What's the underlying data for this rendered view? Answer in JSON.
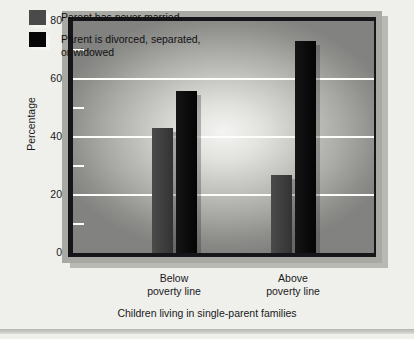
{
  "chart_data": {
    "type": "bar",
    "title": "",
    "xlabel": "Children living in single-parent families",
    "ylabel": "Percentage",
    "categories": [
      "Below\npoverty line",
      "Above\npoverty line"
    ],
    "series": [
      {
        "name": "Parent has never married",
        "values": [
          43,
          27
        ],
        "color": "#3d3d3d"
      },
      {
        "name": "Parent is divorced, separated,\nor widowed",
        "values": [
          56,
          73
        ],
        "color": "#070707"
      }
    ],
    "ylim": [
      0,
      80
    ],
    "yticks": [
      0,
      20,
      40,
      60,
      80
    ],
    "ytick_labels": [
      "0",
      "20",
      "40",
      "60",
      "80"
    ],
    "minor_tick_step": 10,
    "gridlines": [
      20,
      40,
      60
    ],
    "grid": true,
    "legend_position": "top-left"
  },
  "legend": {
    "items": [
      {
        "label": "Parent has never married",
        "swatch": "gray-swatch-icon"
      },
      {
        "label": "Parent is divorced, separated,\nor widowed",
        "swatch": "black-swatch-icon"
      }
    ]
  },
  "axes": {
    "y_title": "Percentage",
    "y_tick_0": "0",
    "y_tick_20": "20",
    "y_tick_40": "40",
    "y_tick_60": "60",
    "y_tick_80": "80",
    "x_tick_1": "Below\npoverty line",
    "x_tick_2": "Above\npoverty line",
    "x_title": "Children living in single-parent families"
  },
  "colors": {
    "never_married": "#3d3d3d",
    "divorced": "#070707",
    "gridline": "#fdfdfb",
    "page_background": "#efefec",
    "frame": "#16161a",
    "mat": "#a9a9a4"
  }
}
